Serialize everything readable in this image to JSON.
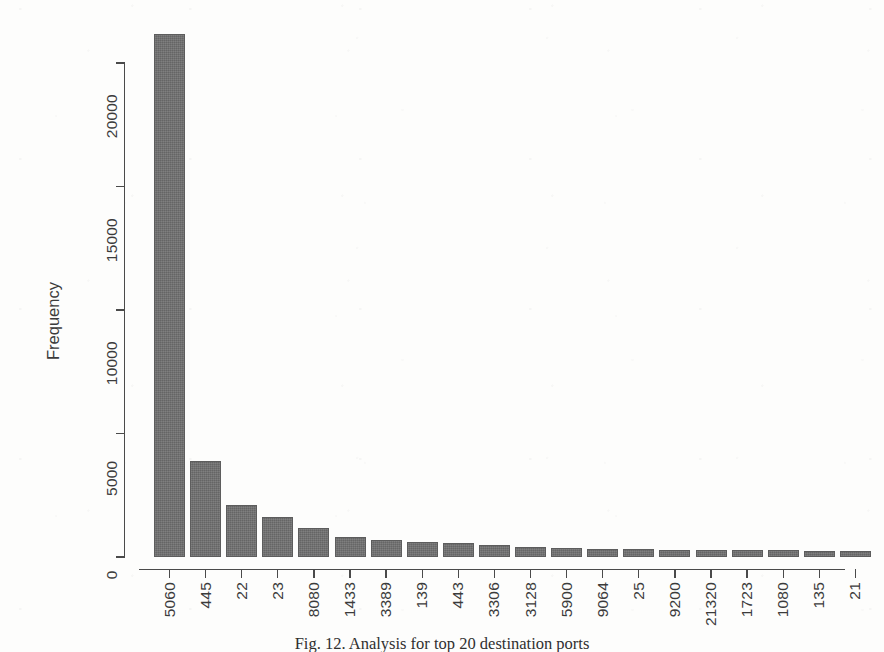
{
  "chart_data": {
    "type": "bar",
    "title": "",
    "xlabel": "",
    "ylabel": "Frequency",
    "categories": [
      "5060",
      "445",
      "22",
      "23",
      "8080",
      "1433",
      "3389",
      "139",
      "443",
      "3306",
      "3128",
      "5900",
      "9064",
      "25",
      "9200",
      "21320",
      "1723",
      "1080",
      "135",
      "21"
    ],
    "values": [
      21180,
      3890,
      2105,
      1620,
      1175,
      810,
      690,
      625,
      585,
      470,
      400,
      350,
      330,
      320,
      300,
      285,
      275,
      265,
      250,
      240
    ],
    "ylim": [
      0,
      21500
    ],
    "y_ticks": [
      0,
      5000,
      10000,
      15000,
      20000
    ],
    "y_tick_labels": [
      "0",
      "5000",
      "10000",
      "15000",
      "20000"
    ],
    "grid": false,
    "legend": false,
    "legend_position": "none",
    "bar_color": "#717171",
    "bar_border_color": "#5d5d5d",
    "axis_color": "#4a4a4a",
    "text_color": "#3b3b3b",
    "orientation": "vertical",
    "tick_label_rotation": -90,
    "annotation": "Bar heights read off the Frequency axis; categories are destination port numbers ordered by descending frequency."
  },
  "caption": {
    "text": "Fig. 12. Analysis for top 20 destination ports"
  },
  "axes": {
    "y_title": "Frequency"
  }
}
